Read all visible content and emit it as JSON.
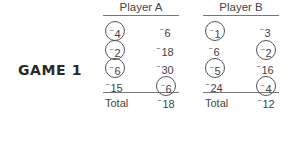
{
  "game": {
    "label": "GAME 1"
  },
  "players": [
    {
      "name": "Player A",
      "rows": [
        [
          {
            "value": "4",
            "negative": true,
            "circled": true
          },
          {
            "value": "6",
            "negative": true,
            "circled": false
          }
        ],
        [
          {
            "value": "2",
            "negative": true,
            "circled": true
          },
          {
            "value": "18",
            "negative": true,
            "circled": false
          }
        ],
        [
          {
            "value": "6",
            "negative": true,
            "circled": true
          },
          {
            "value": "30",
            "negative": true,
            "circled": false
          }
        ],
        [
          {
            "value": "15",
            "negative": true,
            "circled": false
          },
          {
            "value": "6",
            "negative": true,
            "circled": true
          }
        ]
      ],
      "total_label": "Total",
      "total_value": "18",
      "total_negative": true
    },
    {
      "name": "Player B",
      "rows": [
        [
          {
            "value": "1",
            "negative": true,
            "circled": true
          },
          {
            "value": "3",
            "negative": true,
            "circled": false
          }
        ],
        [
          {
            "value": "6",
            "negative": true,
            "circled": false
          },
          {
            "value": "2",
            "negative": true,
            "circled": true
          }
        ],
        [
          {
            "value": "5",
            "negative": true,
            "circled": true
          },
          {
            "value": "16",
            "negative": true,
            "circled": false
          }
        ],
        [
          {
            "value": "24",
            "negative": true,
            "circled": false
          },
          {
            "value": "4",
            "negative": true,
            "circled": true
          }
        ]
      ],
      "total_label": "Total",
      "total_value": "12",
      "total_negative": true
    }
  ]
}
